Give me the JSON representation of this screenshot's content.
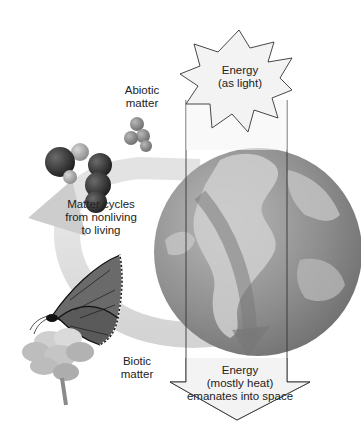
{
  "diagram": {
    "type": "energy-matter-flow",
    "labels": {
      "abiotic": [
        "Abiotic",
        "matter"
      ],
      "cycle": [
        "Matter cycles",
        "from nonliving",
        "to living"
      ],
      "biotic": [
        "Biotic",
        "matter"
      ],
      "energy_in": [
        "Energy",
        "(as light)"
      ],
      "energy_out": [
        "Energy",
        "(mostly heat)",
        "emanates into space"
      ]
    },
    "colors": {
      "background": "#ffffff",
      "starburst_fill": "#f2f2f2",
      "arrow_fill": "#f0f0f0",
      "outline": "#333333",
      "globe_ocean": "#8e8e8e",
      "globe_land": "#c8c8c8",
      "cycle_arrow": "#d4d4d4",
      "molecule_dark": "#2e2e2e",
      "molecule_light": "#9a9a9a"
    },
    "icons": [
      "sun-starburst-icon",
      "globe-icon",
      "molecule-icon",
      "butterfly-icon",
      "flower-icon",
      "cycle-arrow-icon",
      "down-arrow-icon"
    ]
  }
}
